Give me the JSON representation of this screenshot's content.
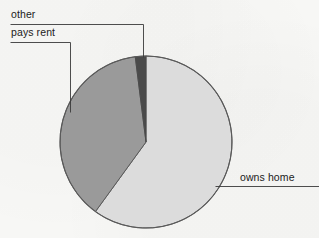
{
  "figure": {
    "background_color": "#f7f7f5",
    "width": 319,
    "height": 238
  },
  "chart_data": {
    "type": "pie",
    "title": "",
    "subtitle": "",
    "xlabel": "",
    "ylabel": "",
    "grid": false,
    "legend": "none",
    "labels_position": "callout-leader-lines",
    "categories": [
      "owns home",
      "pays rent",
      "other"
    ],
    "values": [
      60,
      38,
      2
    ],
    "units": "percent",
    "slices": [
      {
        "label": "owns home",
        "value": 60,
        "color": "#dcdcdc",
        "start_angle_deg": 0,
        "end_angle_deg": 216,
        "leader_line": "horizontal-right"
      },
      {
        "label": "pays rent",
        "value": 38,
        "color": "#9a9a9a",
        "start_angle_deg": 216,
        "end_angle_deg": 353,
        "leader_line": "up-then-left"
      },
      {
        "label": "other",
        "value": 2,
        "color": "#4a4a4a",
        "start_angle_deg": 353,
        "end_angle_deg": 360,
        "leader_line": "up-then-left"
      }
    ],
    "geometry": {
      "center_x": 146,
      "center_y": 142,
      "radius": 86,
      "start_at_twelve_oclock": true,
      "direction": "clockwise"
    },
    "stroke_color": "#555555",
    "leader_line_color": "#3a3a3a"
  },
  "labels": {
    "other": "other",
    "pays_rent": "pays rent",
    "owns_home": "owns home"
  }
}
